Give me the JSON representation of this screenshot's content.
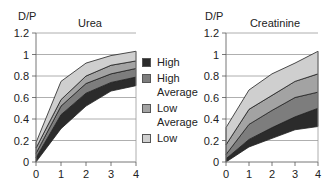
{
  "legend": {
    "items": [
      {
        "label": "High",
        "color": "#2b2b2b"
      },
      {
        "label": "High\nAverage",
        "color": "#7d7d7d"
      },
      {
        "label": "Low\nAverage",
        "color": "#a3a3a3"
      },
      {
        "label": "Low",
        "color": "#cfcfcf"
      }
    ]
  },
  "chart_data": [
    {
      "type": "area",
      "title": "Urea",
      "ylabel": "D/P",
      "xlabel": "",
      "x": [
        0,
        1,
        2,
        3,
        4
      ],
      "xticks": [
        "0",
        "1",
        "2",
        "3",
        "4"
      ],
      "yticks": [
        "0",
        "0.2",
        "0.4",
        "0.6",
        "0.8",
        "1",
        "1.2"
      ],
      "ylim": [
        0,
        1.2
      ],
      "grid": true,
      "legend_position": "between charts",
      "bands": [
        {
          "name": "High",
          "lower": [
            0.0,
            0.31,
            0.52,
            0.66,
            0.71
          ],
          "upper": [
            0.04,
            0.44,
            0.64,
            0.74,
            0.79
          ],
          "color": "#2b2b2b"
        },
        {
          "name": "High Average",
          "lower": [
            0.04,
            0.44,
            0.64,
            0.74,
            0.79
          ],
          "upper": [
            0.08,
            0.52,
            0.73,
            0.82,
            0.87
          ],
          "color": "#7d7d7d"
        },
        {
          "name": "Low Average",
          "lower": [
            0.08,
            0.52,
            0.73,
            0.82,
            0.87
          ],
          "upper": [
            0.13,
            0.58,
            0.8,
            0.9,
            0.94
          ],
          "color": "#a3a3a3"
        },
        {
          "name": "Low",
          "lower": [
            0.13,
            0.58,
            0.8,
            0.9,
            0.94
          ],
          "upper": [
            0.18,
            0.75,
            0.92,
            0.99,
            1.03
          ],
          "color": "#cfcfcf"
        }
      ]
    },
    {
      "type": "area",
      "title": "Creatinine",
      "ylabel": "D/P",
      "xlabel": "",
      "x": [
        0,
        1,
        2,
        3,
        4
      ],
      "xticks": [
        "0",
        "1",
        "2",
        "3",
        "4"
      ],
      "yticks": [
        "0",
        "0.2",
        "0.4",
        "0.6",
        "0.8",
        "1",
        "1.2"
      ],
      "ylim": [
        0,
        1.2
      ],
      "grid": true,
      "bands": [
        {
          "name": "High",
          "lower": [
            0.0,
            0.14,
            0.22,
            0.3,
            0.33
          ],
          "upper": [
            0.03,
            0.21,
            0.32,
            0.42,
            0.5
          ],
          "color": "#2b2b2b"
        },
        {
          "name": "High Average",
          "lower": [
            0.03,
            0.21,
            0.32,
            0.42,
            0.5
          ],
          "upper": [
            0.07,
            0.35,
            0.48,
            0.6,
            0.65
          ],
          "color": "#7d7d7d"
        },
        {
          "name": "Low Average",
          "lower": [
            0.07,
            0.35,
            0.48,
            0.6,
            0.65
          ],
          "upper": [
            0.16,
            0.49,
            0.62,
            0.75,
            0.82
          ],
          "color": "#a3a3a3"
        },
        {
          "name": "Low",
          "lower": [
            0.16,
            0.49,
            0.62,
            0.75,
            0.82
          ],
          "upper": [
            0.32,
            0.67,
            0.82,
            0.92,
            1.03
          ],
          "color": "#cfcfcf"
        }
      ]
    }
  ]
}
